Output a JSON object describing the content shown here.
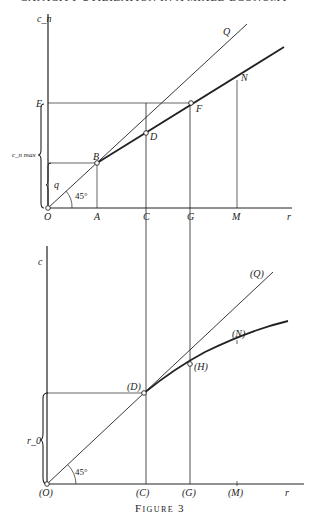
{
  "page": {
    "running_header": "CAPACITY UTILIZATION IN A MIXED ECONOMY",
    "caption": "Figure 3"
  },
  "top_diagram": {
    "y_axis_label": "c_n",
    "x_axis_label": "r",
    "points": {
      "O": "O",
      "A": "A",
      "C": "C",
      "G": "G",
      "M": "M",
      "B": "B",
      "D": "D",
      "E": "E",
      "F": "F",
      "N": "N",
      "Q": "Q"
    },
    "brace_outer_label": "c_n max",
    "brace_inner_label": "q",
    "angle_label": "45°"
  },
  "bottom_diagram": {
    "y_axis_label": "c",
    "x_axis_label": "r",
    "points": {
      "O": "(O)",
      "C": "(C)",
      "G": "(G)",
      "M": "(M)",
      "D": "(D)",
      "H": "(H)",
      "N": "(N)",
      "Q": "(Q)"
    },
    "brace_label": "r_0",
    "angle_label": "45°"
  }
}
